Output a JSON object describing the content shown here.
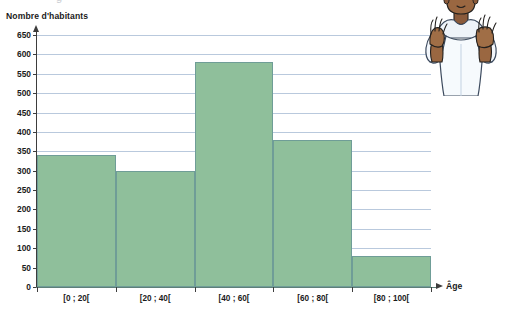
{
  "figure": {
    "cropped_title_fragment_left": "g",
    "cropped_title_fragment_right": "—"
  },
  "axes": {
    "y_title": "Nombre d'habitants",
    "x_title": "Âge",
    "y_ticks": [
      "0",
      "50",
      "100",
      "150",
      "200",
      "250",
      "300",
      "350",
      "400",
      "450",
      "500",
      "550",
      "600",
      "650"
    ]
  },
  "illustration": {
    "name": "person-with-raised-hands-illustration"
  },
  "chart_data": {
    "type": "bar",
    "title": "",
    "subtitle": "",
    "xlabel": "Âge",
    "ylabel": "Nombre d'habitants",
    "categories": [
      "[0 ; 20[",
      "[20 ; 40[",
      "[40 ; 60[",
      "[60 ; 80[",
      "[80 ; 100["
    ],
    "values": [
      340,
      300,
      580,
      378,
      80
    ],
    "ylim": [
      0,
      650
    ],
    "ytick_step": 50,
    "yticks": [
      0,
      50,
      100,
      150,
      200,
      250,
      300,
      350,
      400,
      450,
      500,
      550,
      600,
      650
    ],
    "grid": true,
    "legend": false,
    "bar_fill_color": "#8fbf9b",
    "bar_border_color": "#6f9d97",
    "gridline_color": "#b9c9dd",
    "axis_color": "#3d3d3d",
    "contiguous_bars": true
  }
}
